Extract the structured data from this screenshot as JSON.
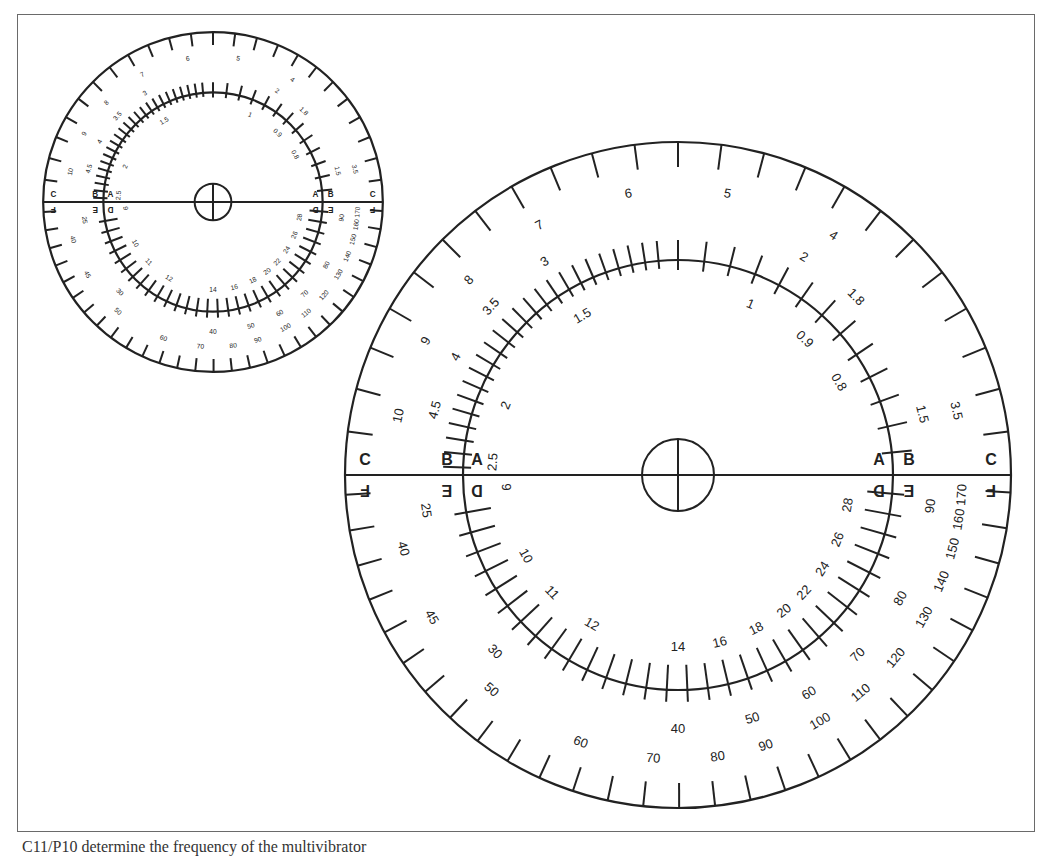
{
  "figure": {
    "caption": "C11/P10 determine the frequency of the multivibrator",
    "ink_color": "#222222",
    "frame_color": "#6a6a6a"
  },
  "dials": [
    {
      "id": "large",
      "scale_letters_top": [
        "C",
        "B",
        "A",
        "A",
        "B",
        "C"
      ],
      "scale_letters_bottom": [
        "F",
        "E",
        "D",
        "D",
        "E",
        "F"
      ],
      "scales": {
        "C": [
          "10",
          "9",
          "8",
          "7",
          "6",
          "5",
          "4",
          "3.5"
        ],
        "B": [
          "4.5",
          "4",
          "3.5",
          "3",
          "2",
          "1.8",
          "1.5"
        ],
        "A": [
          "2.5",
          "2",
          "1.5",
          "1",
          "0.9",
          "0.8"
        ],
        "D": [
          "9",
          "10",
          "11",
          "12",
          "14",
          "16",
          "18",
          "20",
          "22",
          "24",
          "26",
          "28"
        ],
        "E": [
          "25",
          "30",
          "40",
          "50",
          "60",
          "70",
          "80",
          "90"
        ],
        "F": [
          "40",
          "45",
          "50",
          "60",
          "70",
          "80",
          "90",
          "100",
          "110",
          "120",
          "130",
          "140",
          "150",
          "160",
          "170"
        ]
      }
    },
    {
      "id": "small",
      "note": "Reduced copy of the same dial"
    }
  ]
}
